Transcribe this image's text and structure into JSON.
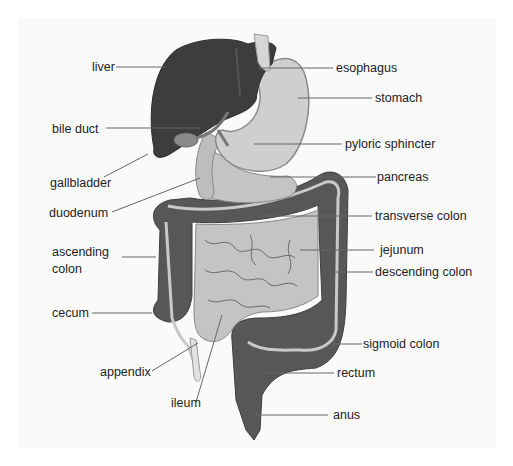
{
  "labels": {
    "liver": "liver",
    "bile_duct": "bile duct",
    "gallbladder": "gallbladder",
    "duodenum": "duodenum",
    "ascending_colon_1": "ascending",
    "ascending_colon_2": "colon",
    "cecum": "cecum",
    "appendix": "appendix",
    "ileum": "ileum",
    "esophagus": "esophagus",
    "stomach": "stomach",
    "pyloric_sphincter": "pyloric sphincter",
    "pancreas": "pancreas",
    "transverse_colon": "transverse colon",
    "jejunum": "jejunum",
    "descending_colon": "descending colon",
    "sigmoid_colon": "sigmoid colon",
    "rectum": "rectum",
    "anus": "anus"
  },
  "colors": {
    "liver": "#3d3d3d",
    "stomach": "#cfcfcf",
    "organ_outline": "#8a8a8a",
    "colon": "#575757",
    "small_intestine": "#c4c4c4",
    "leader_line": "#666666",
    "text": "#222222"
  }
}
